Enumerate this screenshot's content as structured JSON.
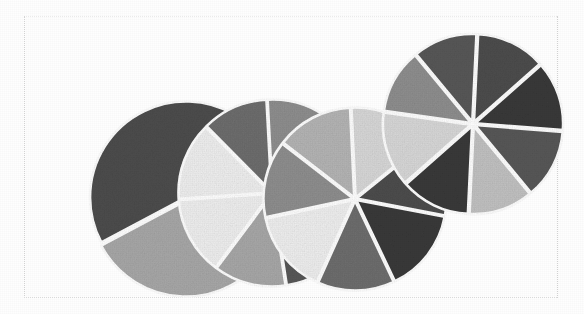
{
  "figure": {
    "caption": "",
    "background_color": "#fefefe",
    "frame_color": "#d8d8d8",
    "wedge_gap_color": "#ffffff",
    "width": 584,
    "height": 314
  },
  "chart_data": {
    "type": "pie",
    "title": "",
    "subtitle": "",
    "xlabel": "",
    "ylabel": "",
    "grid": false,
    "legend_position": "none",
    "palette": [
      "#4d4d4d",
      "#a8a8a8",
      "#efefef",
      "#6e6e6e",
      "#8f8f8f",
      "#d8d8d8",
      "#c2c2c2",
      "#3a3a3a",
      "#585858",
      "#b5b5b5"
    ],
    "pies": [
      {
        "name": "Pie 1",
        "center_x": 186,
        "center_y": 199,
        "radius": 96,
        "start_angle": 152,
        "explode": 1.6,
        "slices": [
          {
            "label": "A",
            "value": 26,
            "color": "#4d4d4d"
          },
          {
            "label": "B",
            "value": 13,
            "color": "#a8a8a8"
          }
        ]
      },
      {
        "name": "Pie 2",
        "center_x": 272,
        "center_y": 193,
        "radius": 92,
        "start_angle": 176,
        "explode": 1.6,
        "slices": [
          {
            "label": "A",
            "value": 13,
            "color": "#efefef"
          },
          {
            "label": "B",
            "value": 11,
            "color": "#6e6e6e"
          },
          {
            "label": "C",
            "value": 11,
            "color": "#8f8f8f"
          },
          {
            "label": "D",
            "value": 11,
            "color": "#d8d8d8"
          },
          {
            "label": "E",
            "value": 12,
            "color": "#c2c2c2"
          },
          {
            "label": "F",
            "value": 12,
            "color": "#585858"
          },
          {
            "label": "G",
            "value": 12,
            "color": "#a8a8a8"
          },
          {
            "label": "H",
            "value": 13,
            "color": "#efefef"
          }
        ]
      },
      {
        "name": "Pie 3",
        "center_x": 355,
        "center_y": 199,
        "radius": 90,
        "start_angle": 168,
        "explode": 1.6,
        "slices": [
          {
            "label": "A",
            "value": 12,
            "color": "#8f8f8f"
          },
          {
            "label": "B",
            "value": 12,
            "color": "#b5b5b5"
          },
          {
            "label": "C",
            "value": 13,
            "color": "#d8d8d8"
          },
          {
            "label": "D",
            "value": 12,
            "color": "#4d4d4d"
          },
          {
            "label": "E",
            "value": 13,
            "color": "#3a3a3a"
          },
          {
            "label": "F",
            "value": 12,
            "color": "#6e6e6e"
          },
          {
            "label": "G",
            "value": 13,
            "color": "#efefef"
          }
        ]
      },
      {
        "name": "Pie 4",
        "center_x": 473,
        "center_y": 124,
        "radius": 88,
        "start_angle": 188,
        "explode": 2.2,
        "slices": [
          {
            "label": "A",
            "value": 12,
            "color": "#8f8f8f"
          },
          {
            "label": "B",
            "value": 12,
            "color": "#585858"
          },
          {
            "label": "C",
            "value": 13,
            "color": "#4d4d4d"
          },
          {
            "label": "D",
            "value": 13,
            "color": "#3a3a3a"
          },
          {
            "label": "E",
            "value": 13,
            "color": "#585858"
          },
          {
            "label": "F",
            "value": 12,
            "color": "#c2c2c2"
          },
          {
            "label": "G",
            "value": 13,
            "color": "#3a3a3a"
          },
          {
            "label": "H",
            "value": 14,
            "color": "#d8d8d8"
          }
        ]
      }
    ]
  }
}
